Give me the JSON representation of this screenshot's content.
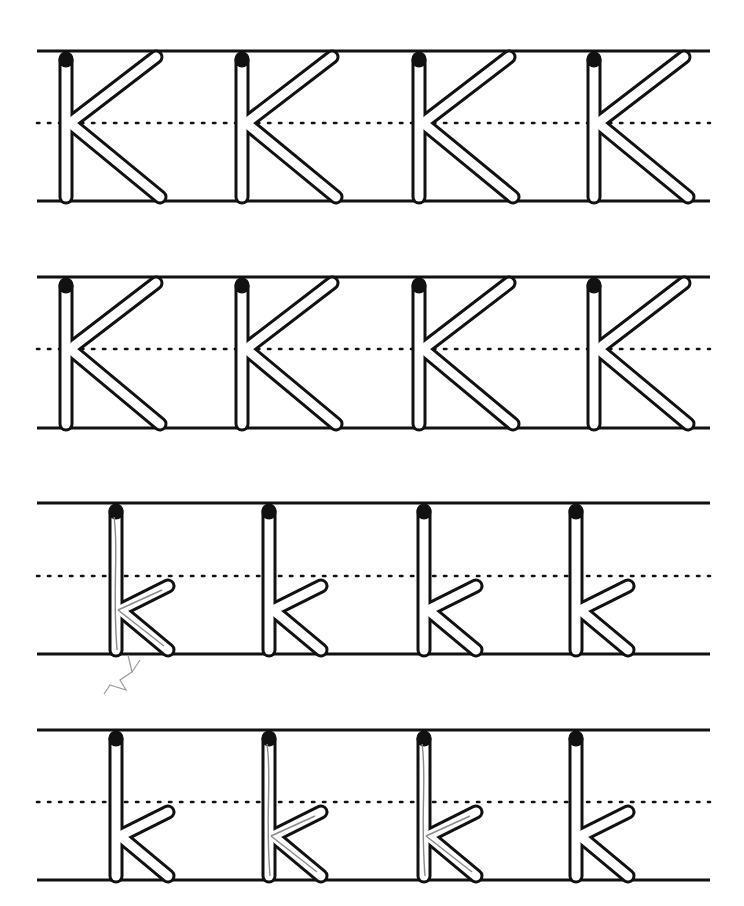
{
  "worksheet": {
    "title": "Letter K handwriting practice",
    "line_color": "#111111",
    "guide_x_start": 37,
    "guide_x_end": 710,
    "rows": [
      {
        "case": "upper",
        "letter": "K",
        "top": 51,
        "mid": 123,
        "bottom": 201,
        "letters_x": [
          66,
          242,
          419,
          594
        ],
        "traced": [
          false,
          false,
          false,
          false
        ]
      },
      {
        "case": "upper",
        "letter": "K",
        "top": 277,
        "mid": 349,
        "bottom": 428,
        "letters_x": [
          66,
          242,
          419,
          594
        ],
        "traced": [
          false,
          false,
          false,
          false
        ]
      },
      {
        "case": "lower",
        "letter": "k",
        "top": 503,
        "mid": 576,
        "bottom": 654,
        "letters_x": [
          116,
          269,
          424,
          576
        ],
        "traced": [
          true,
          false,
          false,
          false
        ]
      },
      {
        "case": "lower",
        "letter": "k",
        "top": 730,
        "mid": 802,
        "bottom": 880,
        "letters_x": [
          116,
          269,
          424,
          576
        ],
        "traced": [
          false,
          true,
          true,
          false
        ]
      }
    ]
  }
}
